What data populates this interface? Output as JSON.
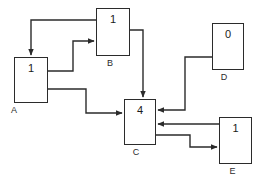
{
  "diagram": {
    "type": "directed-graph",
    "background_color": "#ffffff",
    "stroke_color": "#2b2b2b",
    "nodes": [
      {
        "id": "A",
        "label": "A",
        "value": "1",
        "x": 14,
        "y": 57,
        "w": 34,
        "h": 46,
        "label_x": -3,
        "label_y": 105
      },
      {
        "id": "B",
        "label": "B",
        "value": "1",
        "x": 96,
        "y": 8,
        "w": 34,
        "h": 48,
        "label_x": 93,
        "label_y": 58
      },
      {
        "id": "C",
        "label": "C",
        "value": "4",
        "x": 124,
        "y": 99,
        "w": 32,
        "h": 46,
        "label_x": 120,
        "label_y": 147
      },
      {
        "id": "D",
        "label": "D",
        "value": "0",
        "x": 212,
        "y": 23,
        "w": 32,
        "h": 47,
        "label_x": 208,
        "label_y": 72
      },
      {
        "id": "E",
        "label": "E",
        "value": "1",
        "x": 219,
        "y": 117,
        "w": 33,
        "h": 47,
        "label_x": 216,
        "label_y": 166
      }
    ],
    "edges": [
      {
        "id": "B-to-A",
        "from": "B",
        "to": "A",
        "points": "96,20 31,20 31,55",
        "arrow": "down"
      },
      {
        "id": "A-to-B",
        "from": "A",
        "to": "B",
        "points": "48,71 73,71 73,41 94,41",
        "arrow": "right"
      },
      {
        "id": "A-to-C",
        "from": "A",
        "to": "C",
        "points": "48,89 86,89 86,113 122,113",
        "arrow": "right"
      },
      {
        "id": "B-to-C",
        "from": "B",
        "to": "C",
        "points": "130,30 143,30 143,97",
        "arrow": "down"
      },
      {
        "id": "D-to-C",
        "from": "D",
        "to": "C",
        "points": "212,57 185,57 185,110 158,110",
        "arrow": "left"
      },
      {
        "id": "E-to-C",
        "from": "E",
        "to": "C",
        "points": "219,124 158,124",
        "arrow": "left"
      },
      {
        "id": "C-to-E",
        "from": "C",
        "to": "E",
        "points": "156,135 190,135 190,147 217,147",
        "arrow": "right"
      }
    ]
  }
}
